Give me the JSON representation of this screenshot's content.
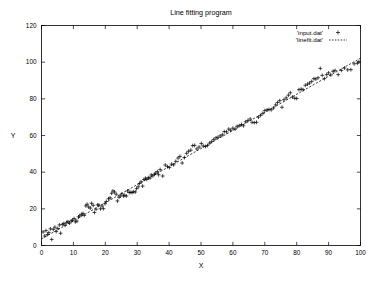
{
  "chart_data": {
    "type": "scatter",
    "title": "Line fitting program",
    "xlabel": "X",
    "ylabel": "Y",
    "xlim": [
      0,
      100
    ],
    "ylim": [
      0,
      120
    ],
    "xticks": [
      0,
      10,
      20,
      30,
      40,
      50,
      60,
      70,
      80,
      90,
      100
    ],
    "yticks": [
      0,
      20,
      40,
      60,
      80,
      100,
      120
    ],
    "grid": false,
    "legend_position": "top-right",
    "series": [
      {
        "name": "'input.dat'",
        "type": "scatter",
        "marker": "plus",
        "points": [
          [
            0.5,
            7.4
          ],
          [
            1.0,
            5.2
          ],
          [
            1.4,
            8.1
          ],
          [
            1.9,
            6.0
          ],
          [
            2.3,
            7.0
          ],
          [
            2.8,
            9.1
          ],
          [
            3.2,
            3.3
          ],
          [
            3.7,
            8.8
          ],
          [
            4.2,
            10.0
          ],
          [
            4.6,
            7.6
          ],
          [
            5.1,
            9.3
          ],
          [
            5.6,
            11.2
          ],
          [
            6.0,
            6.7
          ],
          [
            6.5,
            11.5
          ],
          [
            7.0,
            12.0
          ],
          [
            7.4,
            11.0
          ],
          [
            7.9,
            12.6
          ],
          [
            8.3,
            13.0
          ],
          [
            8.8,
            12.2
          ],
          [
            9.3,
            13.4
          ],
          [
            9.7,
            13.8
          ],
          [
            10.2,
            14.7
          ],
          [
            10.6,
            12.9
          ],
          [
            11.1,
            13.3
          ],
          [
            11.6,
            15.6
          ],
          [
            12.0,
            16.2
          ],
          [
            12.5,
            17.0
          ],
          [
            13.0,
            17.5
          ],
          [
            13.4,
            16.4
          ],
          [
            13.9,
            21.6
          ],
          [
            14.3,
            22.5
          ],
          [
            14.8,
            21.0
          ],
          [
            15.3,
            20.4
          ],
          [
            15.7,
            23.0
          ],
          [
            16.2,
            21.9
          ],
          [
            16.6,
            18.0
          ],
          [
            17.1,
            19.8
          ],
          [
            17.6,
            22.2
          ],
          [
            18.0,
            22.0
          ],
          [
            18.5,
            20.0
          ],
          [
            19.0,
            21.5
          ],
          [
            19.4,
            20.1
          ],
          [
            19.9,
            22.8
          ],
          [
            20.3,
            24.0
          ],
          [
            21.0,
            25.5
          ],
          [
            21.5,
            26.0
          ],
          [
            22.0,
            28.5
          ],
          [
            22.4,
            29.8
          ],
          [
            22.9,
            29.2
          ],
          [
            23.4,
            28.0
          ],
          [
            23.8,
            24.3
          ],
          [
            24.3,
            26.3
          ],
          [
            24.7,
            27.0
          ],
          [
            25.2,
            28.2
          ],
          [
            25.7,
            27.0
          ],
          [
            26.1,
            27.4
          ],
          [
            26.6,
            27.0
          ],
          [
            27.0,
            29.8
          ],
          [
            27.5,
            28.9
          ],
          [
            28.0,
            29.0
          ],
          [
            28.4,
            28.9
          ],
          [
            28.9,
            29.3
          ],
          [
            29.4,
            29.2
          ],
          [
            29.8,
            31.0
          ],
          [
            30.3,
            32.0
          ],
          [
            30.7,
            33.8
          ],
          [
            31.2,
            34.7
          ],
          [
            31.7,
            32.4
          ],
          [
            32.1,
            36.0
          ],
          [
            32.6,
            36.7
          ],
          [
            33.0,
            36.0
          ],
          [
            33.5,
            37.0
          ],
          [
            34.0,
            36.8
          ],
          [
            34.4,
            38.5
          ],
          [
            34.9,
            38.0
          ],
          [
            35.4,
            38.9
          ],
          [
            35.8,
            39.4
          ],
          [
            36.3,
            40.3
          ],
          [
            36.7,
            38.6
          ],
          [
            37.2,
            41.4
          ],
          [
            38.0,
            37.9
          ],
          [
            38.8,
            43.9
          ],
          [
            39.5,
            43.0
          ],
          [
            40.1,
            42.5
          ],
          [
            40.8,
            44.4
          ],
          [
            41.4,
            44.0
          ],
          [
            42.1,
            45.9
          ],
          [
            42.8,
            47.7
          ],
          [
            43.4,
            48.6
          ],
          [
            44.1,
            45.0
          ],
          [
            44.8,
            48.0
          ],
          [
            45.5,
            50.3
          ],
          [
            46.1,
            51.4
          ],
          [
            46.8,
            52.0
          ],
          [
            47.4,
            54.5
          ],
          [
            48.0,
            54.6
          ],
          [
            48.7,
            52.7
          ],
          [
            49.4,
            53.7
          ],
          [
            50.1,
            55.6
          ],
          [
            50.7,
            54.3
          ],
          [
            51.4,
            54.0
          ],
          [
            52.0,
            54.5
          ],
          [
            52.7,
            55.9
          ],
          [
            53.4,
            56.8
          ],
          [
            54.0,
            57.9
          ],
          [
            54.7,
            58.7
          ],
          [
            55.3,
            59.0
          ],
          [
            56.0,
            59.8
          ],
          [
            56.7,
            60.4
          ],
          [
            57.3,
            62.1
          ],
          [
            58.0,
            62.0
          ],
          [
            58.7,
            63.5
          ],
          [
            59.3,
            62.9
          ],
          [
            60.0,
            64.0
          ],
          [
            60.7,
            63.5
          ],
          [
            61.3,
            65.0
          ],
          [
            62.0,
            65.4
          ],
          [
            62.7,
            66.0
          ],
          [
            63.3,
            65.3
          ],
          [
            64.0,
            67.5
          ],
          [
            64.7,
            68.2
          ],
          [
            65.4,
            69.0
          ],
          [
            66.0,
            67.2
          ],
          [
            66.7,
            67.0
          ],
          [
            67.4,
            67.2
          ],
          [
            68.0,
            70.0
          ],
          [
            68.7,
            71.0
          ],
          [
            69.4,
            72.1
          ],
          [
            70.0,
            73.6
          ],
          [
            70.7,
            74.0
          ],
          [
            71.3,
            74.2
          ],
          [
            72.0,
            74.0
          ],
          [
            72.7,
            75.0
          ],
          [
            73.4,
            76.7
          ],
          [
            74.0,
            78.0
          ],
          [
            74.7,
            79.0
          ],
          [
            75.4,
            75.4
          ],
          [
            76.0,
            79.5
          ],
          [
            76.7,
            80.5
          ],
          [
            77.4,
            82.0
          ],
          [
            78.0,
            83.3
          ],
          [
            78.7,
            81.0
          ],
          [
            79.4,
            80.3
          ],
          [
            80.0,
            80.2
          ],
          [
            80.7,
            85.0
          ],
          [
            81.4,
            85.3
          ],
          [
            82.0,
            85.0
          ],
          [
            82.7,
            87.4
          ],
          [
            83.4,
            88.0
          ],
          [
            84.0,
            88.6
          ],
          [
            84.7,
            89.5
          ],
          [
            85.4,
            91.0
          ],
          [
            86.0,
            90.8
          ],
          [
            86.7,
            91.5
          ],
          [
            87.4,
            96.6
          ],
          [
            88.0,
            92.8
          ],
          [
            88.7,
            91.0
          ],
          [
            89.4,
            93.2
          ],
          [
            90.0,
            94.2
          ],
          [
            90.7,
            93.0
          ],
          [
            91.4,
            95.0
          ],
          [
            92.0,
            95.5
          ],
          [
            93.0,
            93.2
          ],
          [
            94.0,
            95.5
          ],
          [
            95.0,
            96.8
          ],
          [
            96.0,
            95.8
          ],
          [
            97.0,
            95.9
          ],
          [
            98.0,
            99.1
          ],
          [
            99.0,
            99.4
          ],
          [
            99.5,
            100.2
          ]
        ]
      },
      {
        "name": "'linefit.dat'",
        "type": "line",
        "style": "dashed",
        "endpoints": [
          [
            0,
            3.6
          ],
          [
            100,
            102.2
          ]
        ],
        "slope": 0.986,
        "intercept": 3.6
      }
    ]
  },
  "legend": {
    "entries": [
      {
        "label": "'input.dat'",
        "marker": "plus"
      },
      {
        "label": "'linefit.dat'",
        "marker": "dashed-line"
      }
    ]
  }
}
